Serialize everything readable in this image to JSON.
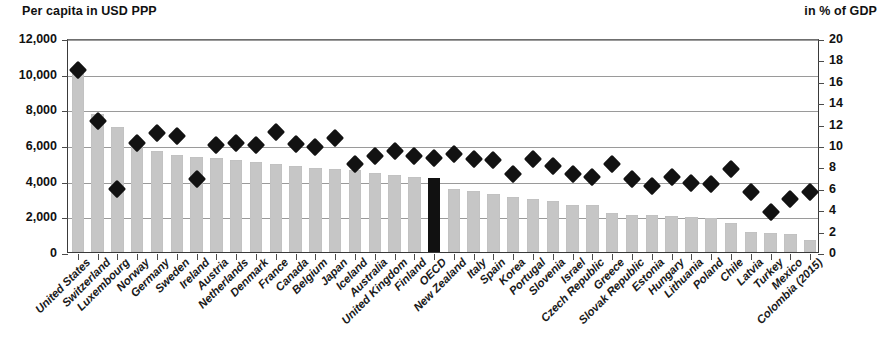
{
  "axes": {
    "left_caption": "Per capita in USD PPP",
    "right_caption": "in % of GDP",
    "left_ticks": [
      "12,000",
      "10,000",
      "8,000",
      "6,000",
      "4,000",
      "2,000",
      "0"
    ],
    "right_ticks": [
      "20",
      "18",
      "16",
      "14",
      "12",
      "10",
      "8",
      "6",
      "4",
      "2",
      "0"
    ]
  },
  "colors": {
    "bar": "#c6c6c6",
    "bar_highlight": "#111111",
    "marker": "#121212",
    "grid": "#9a9a9a",
    "axis": "#3a3a3a"
  },
  "chart_data": {
    "type": "bar",
    "title": "",
    "subtitle": "",
    "xlabel": "",
    "ylabel": "Per capita in USD PPP",
    "y2label": "in % of GDP",
    "ylim": [
      0,
      12000
    ],
    "y2lim": [
      0,
      20
    ],
    "grid": true,
    "legend": null,
    "highlight_category": "OECD",
    "categories": [
      "United States",
      "Switzerland",
      "Luxembourg",
      "Norway",
      "Germany",
      "Sweden",
      "Ireland",
      "Austria",
      "Netherlands",
      "Denmark",
      "France",
      "Canada",
      "Belgium",
      "Japan",
      "Iceland",
      "Australia",
      "United Kingdom",
      "Finland",
      "OECD",
      "New Zealand",
      "Italy",
      "Spain",
      "Korea",
      "Portugal",
      "Slovenia",
      "Israel",
      "Czech Republic",
      "Greece",
      "Slovak Republic",
      "Estonia",
      "Hungary",
      "Lithuania",
      "Poland",
      "Chile",
      "Latvia",
      "Turkey",
      "Mexico",
      "Colombia (2015)"
    ],
    "series": [
      {
        "name": "Per capita in USD PPP",
        "type": "bar",
        "axis": "left",
        "values": [
          10200,
          7750,
          7000,
          6200,
          5650,
          5450,
          5350,
          5250,
          5150,
          5050,
          4950,
          4800,
          4700,
          4650,
          4600,
          4450,
          4300,
          4200,
          4150,
          3550,
          3400,
          3250,
          3100,
          2950,
          2850,
          2650,
          2650,
          2200,
          2100,
          2050,
          2000,
          1950,
          1900,
          1600,
          1100,
          1050,
          1000,
          700
        ]
      },
      {
        "name": "in % of GDP",
        "type": "scatter",
        "axis": "right",
        "marker": "diamond",
        "values": [
          17.2,
          12.4,
          6.1,
          10.4,
          11.3,
          11.0,
          7.0,
          10.2,
          10.4,
          10.2,
          11.4,
          10.3,
          10.0,
          10.8,
          8.4,
          9.2,
          9.6,
          9.2,
          9.0,
          9.3,
          8.9,
          8.8,
          7.5,
          8.9,
          8.2,
          7.5,
          7.2,
          8.4,
          7.0,
          6.4,
          7.2,
          6.6,
          6.5,
          7.9,
          5.8,
          3.9,
          5.1,
          5.8
        ]
      }
    ]
  }
}
